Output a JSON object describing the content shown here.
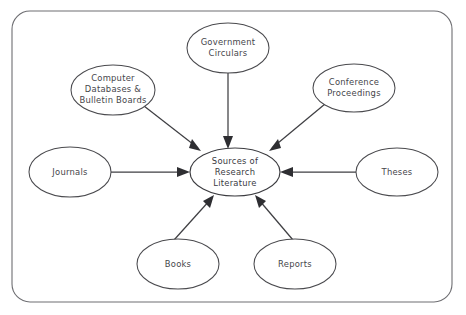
{
  "diagram": {
    "title": "Sources of Research Literature",
    "type": "concept-spider-diagram",
    "background_color": "#ffffff",
    "stroke_color": "#3f3f43",
    "frame_color": "#6e6e72",
    "text_color": "#45454a",
    "frame": {
      "x": 12,
      "y": 11,
      "width": 440,
      "height": 291,
      "corner_radius": 18
    },
    "center_node": {
      "id": "sources-of-research-literature",
      "lines": [
        "Sources of",
        "Research",
        "Literature"
      ],
      "cx": 235,
      "cy": 172,
      "rx": 45,
      "ry": 24
    },
    "nodes": [
      {
        "id": "computer-databases-and-bulletin-boards",
        "lines": [
          "Computer",
          "Databases &",
          "Bulletin Boards"
        ],
        "cx": 113,
        "cy": 90,
        "rx": 42,
        "ry": 25,
        "position": "upper-left"
      },
      {
        "id": "government-circulars",
        "lines": [
          "Government",
          "Circulars"
        ],
        "cx": 228,
        "cy": 48,
        "rx": 41,
        "ry": 25,
        "position": "top"
      },
      {
        "id": "conference-proceedings",
        "lines": [
          "Conference",
          "Proceedings"
        ],
        "cx": 354,
        "cy": 88,
        "rx": 41,
        "ry": 24,
        "position": "upper-right"
      },
      {
        "id": "journals",
        "lines": [
          "Journals"
        ],
        "cx": 70,
        "cy": 172,
        "rx": 41,
        "ry": 25,
        "position": "left"
      },
      {
        "id": "theses",
        "lines": [
          "Theses"
        ],
        "cx": 397,
        "cy": 172,
        "rx": 41,
        "ry": 24,
        "position": "right"
      },
      {
        "id": "books",
        "lines": [
          "Books"
        ],
        "cx": 178,
        "cy": 264,
        "rx": 41,
        "ry": 25,
        "position": "bottom-left"
      },
      {
        "id": "reports",
        "lines": [
          "Reports"
        ],
        "cx": 295,
        "cy": 264,
        "rx": 41,
        "ry": 25,
        "position": "bottom-right"
      }
    ],
    "edges": [
      {
        "id": "edge-computer-databases-to-center",
        "from": "computer-databases-and-bulletin-boards",
        "to": "sources-of-research-literature",
        "direction": "inward",
        "x1": 144,
        "y1": 106,
        "x2": 201,
        "y2": 151
      },
      {
        "id": "edge-government-circulars-to-center",
        "from": "government-circulars",
        "to": "sources-of-research-literature",
        "direction": "inward",
        "x1": 228,
        "y1": 73,
        "x2": 228,
        "y2": 147
      },
      {
        "id": "edge-conference-proceedings-to-center",
        "from": "conference-proceedings",
        "to": "sources-of-research-literature",
        "direction": "inward",
        "x1": 325,
        "y1": 104,
        "x2": 269,
        "y2": 151
      },
      {
        "id": "edge-journals-to-center",
        "from": "journals",
        "to": "sources-of-research-literature",
        "direction": "inward",
        "x1": 111,
        "y1": 172,
        "x2": 188,
        "y2": 172
      },
      {
        "id": "edge-theses-to-center",
        "from": "theses",
        "to": "sources-of-research-literature",
        "direction": "inward",
        "x1": 356,
        "y1": 172,
        "x2": 282,
        "y2": 172
      },
      {
        "id": "edge-books-to-center",
        "from": "books",
        "to": "sources-of-research-literature",
        "direction": "inward",
        "x1": 174,
        "y1": 240,
        "x2": 213,
        "y2": 196
      },
      {
        "id": "edge-reports-to-center",
        "from": "reports",
        "to": "sources-of-research-literature",
        "direction": "inward",
        "x1": 293,
        "y1": 240,
        "x2": 256,
        "y2": 196
      }
    ]
  }
}
